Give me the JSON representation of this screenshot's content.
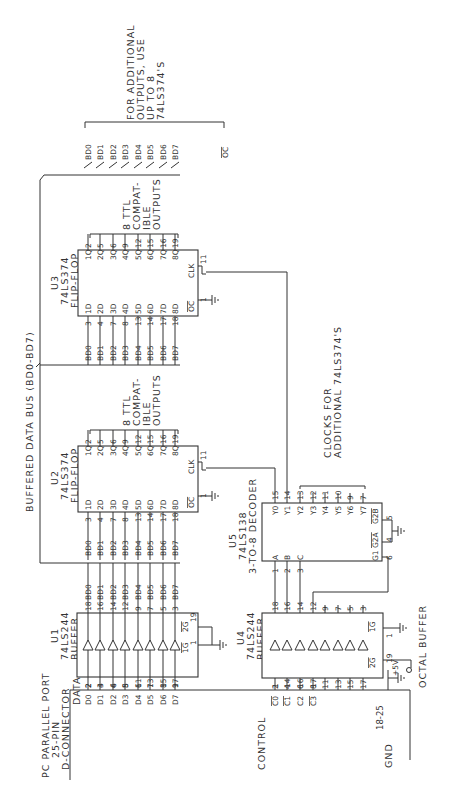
{
  "title_block": {
    "connector_line1": "PC PARALLEL PORT",
    "connector_line2": "25-PIN",
    "connector_line3": "D-CONNECTOR",
    "data_label": "DATA",
    "control_label": "CONTROL",
    "gnd_label": "GND",
    "gnd_pins": "18-25",
    "octal_buffer_label": "OCTAL BUFFER",
    "bus_label": "BUFFERED DATA BUS (BD0-BD7)"
  },
  "connector_data_pins": [
    {
      "name": "D0",
      "pin": "2"
    },
    {
      "name": "D1",
      "pin": "3"
    },
    {
      "name": "D2",
      "pin": "4"
    },
    {
      "name": "D3",
      "pin": "5"
    },
    {
      "name": "D4",
      "pin": "6"
    },
    {
      "name": "D5",
      "pin": "7"
    },
    {
      "name": "D6",
      "pin": "8"
    },
    {
      "name": "D7",
      "pin": "9"
    }
  ],
  "connector_control_pins": [
    {
      "name": "C0",
      "pin": "1",
      "inverted": true
    },
    {
      "name": "C1",
      "pin": "14",
      "inverted": true
    },
    {
      "name": "C2",
      "pin": "16",
      "inverted": false
    },
    {
      "name": "C3",
      "pin": "17",
      "inverted": true
    }
  ],
  "chips": {
    "u1": {
      "ref": "U1",
      "part": "74LS244",
      "desc": "BUFFER",
      "in_pins": [
        "2",
        "4",
        "6",
        "8",
        "11",
        "13",
        "15",
        "17"
      ],
      "out_pins": [
        "18",
        "16",
        "14",
        "12",
        "9",
        "7",
        "5",
        "3"
      ],
      "out_nets": [
        "BD0",
        "BD1",
        "BD2",
        "BD3",
        "BD4",
        "BD5",
        "BD6",
        "BD7"
      ],
      "g1": "1G",
      "g1_pin": "1",
      "g2": "2G",
      "g2_pin": "19"
    },
    "u4": {
      "ref": "U4",
      "part": "74LS244",
      "desc": "BUFFER",
      "in_pins": [
        "2",
        "4",
        "6",
        "8",
        "11",
        "13",
        "15",
        "17"
      ],
      "out_pins": [
        "18",
        "16",
        "14",
        "12",
        "9",
        "7",
        "5",
        "3"
      ],
      "g1": "1G",
      "g1_pin": "1",
      "g2": "2G",
      "g2_pin": "19",
      "vcc": "+5V"
    },
    "u2": {
      "ref": "U2",
      "part": "74LS374",
      "desc": "FLIP-FLOP",
      "d_labels": [
        "1D",
        "2D",
        "3D",
        "4D",
        "5D",
        "6D",
        "7D",
        "8D"
      ],
      "d_pins": [
        "3",
        "4",
        "7",
        "8",
        "13",
        "14",
        "17",
        "18"
      ],
      "q_labels": [
        "1Q",
        "2Q",
        "3Q",
        "4Q",
        "5Q",
        "6Q",
        "7Q",
        "8Q"
      ],
      "q_pins": [
        "2",
        "5",
        "6",
        "9",
        "12",
        "15",
        "16",
        "19"
      ],
      "in_nets": [
        "BD0",
        "BD1",
        "BD2",
        "BD3",
        "BD4",
        "BD5",
        "BD6",
        "BD7"
      ],
      "clk": "CLK",
      "clk_pin": "11",
      "oc": "OC",
      "oc_pin": "1",
      "note_lines": [
        "8 TTL",
        "COMPAT-",
        "IBLE",
        "OUTPUTS"
      ]
    },
    "u3": {
      "ref": "U3",
      "part": "74LS374",
      "desc": "FLIP-FLOP",
      "d_labels": [
        "1D",
        "2D",
        "3D",
        "4D",
        "5D",
        "6D",
        "7D",
        "8D"
      ],
      "d_pins": [
        "3",
        "4",
        "7",
        "8",
        "13",
        "14",
        "17",
        "18"
      ],
      "q_labels": [
        "1Q",
        "2Q",
        "3Q",
        "4Q",
        "5Q",
        "6Q",
        "7Q",
        "8Q"
      ],
      "q_pins": [
        "2",
        "5",
        "6",
        "9",
        "12",
        "15",
        "16",
        "19"
      ],
      "in_nets": [
        "BD0",
        "BD1",
        "BD2",
        "BD3",
        "BD4",
        "BD5",
        "BD6",
        "BD7"
      ],
      "clk": "CLK",
      "clk_pin": "11",
      "oc": "OC",
      "oc_pin": "1",
      "note_lines": [
        "8 TTL",
        "COMPAT-",
        "IBLE",
        "OUTPUTS"
      ]
    },
    "u5": {
      "ref": "U5",
      "part": "74LS138",
      "desc": "3-TO-8 DECODER",
      "inputs": [
        {
          "name": "A",
          "pin": "1"
        },
        {
          "name": "B",
          "pin": "2"
        },
        {
          "name": "C",
          "pin": "3"
        }
      ],
      "outputs": [
        {
          "name": "Y0",
          "pin": "15"
        },
        {
          "name": "Y1",
          "pin": "14"
        },
        {
          "name": "Y2",
          "pin": "13"
        },
        {
          "name": "Y3",
          "pin": "12"
        },
        {
          "name": "Y4",
          "pin": "11"
        },
        {
          "name": "Y5",
          "pin": "10"
        },
        {
          "name": "Y6",
          "pin": "9"
        },
        {
          "name": "Y7",
          "pin": "7"
        }
      ],
      "g1": "G1",
      "g1_pin": "6",
      "g2a": "G2A",
      "g2a_pin": "4",
      "g2b": "G2B",
      "g2b_pin": "5",
      "clock_note_lines": [
        "CLOCKS FOR",
        "ADDITIONAL 74LS374'S"
      ]
    }
  },
  "expansion": {
    "nets": [
      "BD0",
      "BD1",
      "BD2",
      "BD3",
      "BD4",
      "BD5",
      "BD6",
      "BD7"
    ],
    "oc": "OC",
    "note_lines": [
      "FOR ADDITIONAL",
      "OUTPUTS, USE",
      "UP TO 8",
      "74LS374'S"
    ]
  }
}
